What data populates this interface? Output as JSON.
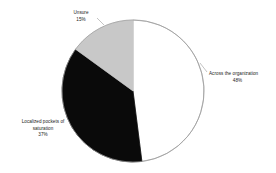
{
  "chart_data": {
    "type": "pie",
    "title": "",
    "subtitle": "",
    "xlabel": "",
    "ylabel": "",
    "legend_position": "none",
    "grid": false,
    "start_angle_deg": 0,
    "direction": "clockwise",
    "categories": [
      "Across the organization",
      "Localized pockets of saturation",
      "Unsure"
    ],
    "values": [
      48,
      37,
      15
    ],
    "value_labels": [
      "48%",
      "37%",
      "15%"
    ],
    "colors": [
      "#ffffff",
      "#0a0a0a",
      "#c8c8c8"
    ],
    "slices": [
      {
        "name": "Across the organization",
        "value": 48,
        "value_label": "48%",
        "color": "#ffffff",
        "label_lines": [
          "Across the organization"
        ]
      },
      {
        "name": "Localized pockets of saturation",
        "value": 37,
        "value_label": "37%",
        "color": "#0a0a0a",
        "label_lines": [
          "Localized pockets of",
          "saturation"
        ]
      },
      {
        "name": "Unsure",
        "value": 15,
        "value_label": "15%",
        "color": "#c8c8c8",
        "label_lines": [
          "Unsure"
        ]
      }
    ]
  },
  "figure": {
    "background": "#ffffff",
    "outline_color": "#9b9b9b",
    "text_color": "#1a1a1a",
    "center_x": 133,
    "center_y": 91,
    "radius": 71
  },
  "labels": {
    "across": {
      "line1": "Across the organization",
      "value": "48%"
    },
    "unsure": {
      "line1": "Unsure",
      "value": "15%"
    },
    "localized": {
      "line1": "Localized pockets of",
      "line2": "saturation",
      "value": "37%"
    }
  }
}
